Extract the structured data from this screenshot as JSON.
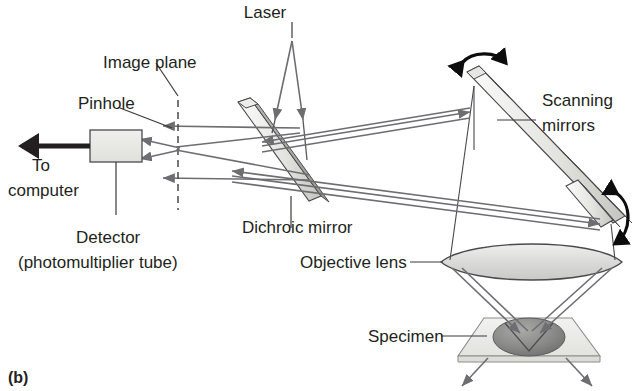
{
  "figure": {
    "panel_id": "(b)",
    "title_semantic": "confocal-microscope-light-path"
  },
  "labels": {
    "laser": "Laser",
    "image_plane": "Image plane",
    "pinhole": "Pinhole",
    "to_computer_line1": "To",
    "to_computer_line2": "computer",
    "detector_line1": "Detector",
    "detector_line2": "(photomultiplier tube)",
    "dichroic_mirror": "Dichroic mirror",
    "scanning_mirrors_line1": "Scanning",
    "scanning_mirrors_line2": "mirrors",
    "objective_lens": "Objective lens",
    "specimen": "Specimen"
  },
  "colors": {
    "ink": "#231f20",
    "ray": "#6e6e72",
    "outline": "#4a4a4d",
    "mirror_light": "#f2f2f0",
    "mirror_mid": "#cfcfcb",
    "lens_fill": "#d8d8d6",
    "specimen_fill": "#8e8e8e",
    "slide_fill": "#ececea",
    "detector_fill": "#e8e8e6",
    "background": "#ffffff"
  },
  "components": [
    {
      "name": "laser",
      "kind": "source",
      "label": "Laser"
    },
    {
      "name": "dichroic-mirror",
      "kind": "mirror",
      "label": "Dichroic mirror",
      "tilt_deg": 58
    },
    {
      "name": "scanning-mirror-upper",
      "kind": "mirror",
      "label": "Scanning mirrors",
      "motion": "rotating"
    },
    {
      "name": "scanning-mirror-lower",
      "kind": "mirror",
      "label": "Scanning mirrors",
      "motion": "rotating"
    },
    {
      "name": "objective-lens",
      "kind": "lens",
      "label": "Objective lens"
    },
    {
      "name": "specimen",
      "kind": "sample",
      "label": "Specimen"
    },
    {
      "name": "image-plane",
      "kind": "plane",
      "label": "Image plane"
    },
    {
      "name": "pinhole",
      "kind": "aperture",
      "label": "Pinhole"
    },
    {
      "name": "detector",
      "kind": "detector",
      "label": "Detector (photomultiplier tube)"
    }
  ],
  "annotations": {
    "rotation_arrows": 2,
    "output_arrow_direction": "left",
    "scattered_light_arrows": 2
  }
}
